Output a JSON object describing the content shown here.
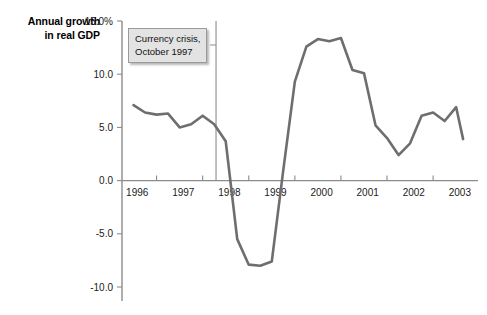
{
  "chart_data": {
    "type": "line",
    "title": "Annual growth in real GDP",
    "title_line1": "Annual growth",
    "title_line2": "in real GDP",
    "xlabel": "",
    "ylabel": "Annual growth in real GDP",
    "ylim": [
      -10.0,
      15.0
    ],
    "xlim": [
      1995.75,
      2003.3
    ],
    "grid": false,
    "legend": "none",
    "y_tick_labels": [
      "15.0%",
      "10.0",
      "5.0",
      "0.0",
      "-5.0",
      "-10.0"
    ],
    "y_tick_values": [
      15.0,
      10.0,
      5.0,
      0.0,
      -5.0,
      -10.0
    ],
    "x_tick_labels": [
      "1996",
      "1997",
      "1998",
      "1999",
      "2000",
      "2001",
      "2002",
      "2003"
    ],
    "x_tick_values": [
      1996,
      1997,
      1998,
      1999,
      2000,
      2001,
      2002,
      2003
    ],
    "annotations": [
      {
        "text_line1": "Currency crisis,",
        "text_line2": "October 1997",
        "text": "Currency crisis, October 1997",
        "x": 1997.79,
        "type": "vertical-line-with-label"
      }
    ],
    "series": [
      {
        "name": "Annual growth in real GDP",
        "color": "#6e6e6e",
        "x": [
          1996.0,
          1996.25,
          1996.5,
          1996.75,
          1997.0,
          1997.25,
          1997.5,
          1997.75,
          1998.0,
          1998.25,
          1998.5,
          1998.75,
          1999.0,
          1999.25,
          1999.5,
          1999.75,
          2000.0,
          2000.25,
          2000.5,
          2000.75,
          2001.0,
          2001.25,
          2001.5,
          2001.75,
          2002.0,
          2002.25,
          2002.5,
          2002.75,
          2003.0,
          2003.15
        ],
        "values": [
          7.1,
          6.4,
          6.2,
          6.3,
          5.0,
          5.3,
          6.1,
          5.3,
          3.7,
          -5.5,
          -7.9,
          -8.0,
          -7.6,
          1.0,
          9.3,
          12.6,
          13.3,
          13.1,
          13.4,
          10.4,
          10.1,
          5.2,
          4.0,
          2.4,
          3.5,
          6.1,
          6.4,
          5.6,
          6.9,
          3.9
        ]
      }
    ]
  }
}
